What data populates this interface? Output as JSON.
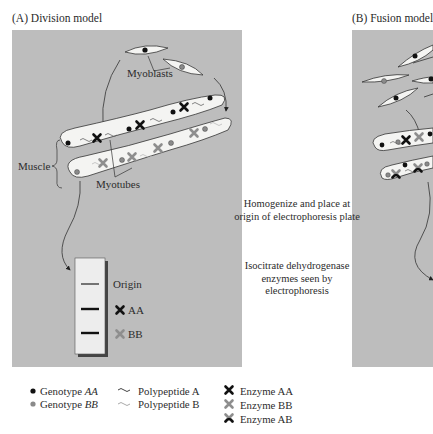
{
  "panels": {
    "a": {
      "title": "(A) Division model",
      "labels": {
        "myoblasts": "Myoblasts",
        "muscle": "Muscle",
        "myotubes": "Myotubes"
      },
      "gel": {
        "origin": "Origin",
        "band_aa": "AA",
        "band_bb": "BB"
      }
    },
    "b": {
      "title": "(B) Fusion model"
    }
  },
  "middle_text": {
    "step1": "Homogenize and place at origin of electrophoresis plate",
    "step2": "Isocitrate dehydrogenase enzymes seen by electrophoresis"
  },
  "legend": {
    "genotype_aa_prefix": "Genotype ",
    "genotype_aa_italic": "AA",
    "genotype_bb_prefix": "Genotype ",
    "genotype_bb_italic": "BB",
    "polypeptide_a": "Polypeptide A",
    "polypeptide_b": "Polypeptide B",
    "enzyme_aa": "Enzyme AA",
    "enzyme_bb": "Enzyme BB",
    "enzyme_ab": "Enzyme AB"
  },
  "colors": {
    "panel_bg": "#bdbdbd",
    "cell_fill": "#f4f4f2",
    "genotype_aa": "#111111",
    "genotype_bb": "#8a8a8a",
    "enzyme_aa": "#111111",
    "enzyme_bb": "#8e8e8e",
    "gel_fill": "#ededed",
    "gel_shadow": "#444444"
  }
}
